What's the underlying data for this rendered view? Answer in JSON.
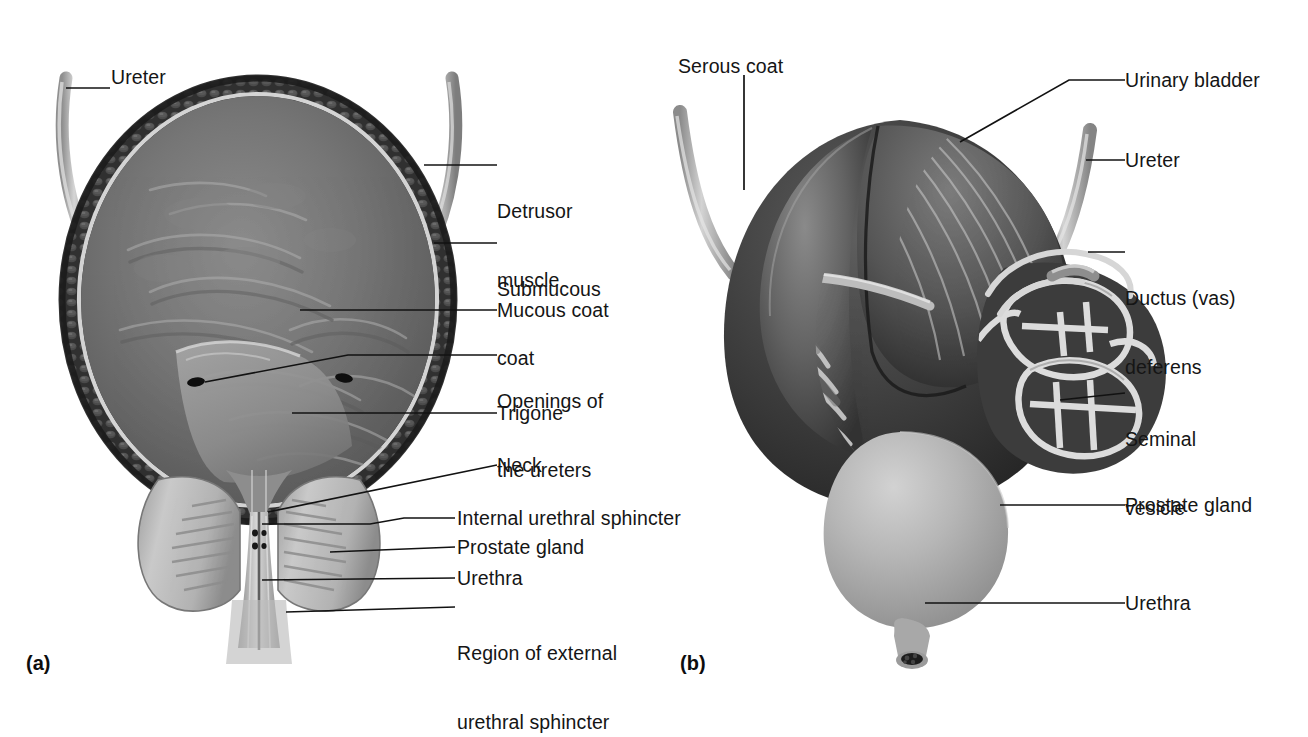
{
  "figure": {
    "background_color": "#ffffff",
    "ink_color": "#151515"
  },
  "panels": [
    {
      "id": "a",
      "letter": "(a)",
      "caption": "Longitudinal section of the urinary bladder and prostatic urethra",
      "labels": [
        {
          "key": "ureter",
          "text": "Ureter"
        },
        {
          "key": "detrusor",
          "text": "Detrusor\nmuscle",
          "line1": "Detrusor",
          "line2": "muscle"
        },
        {
          "key": "submucous",
          "text": "Submucous\ncoat",
          "line1": "Submucous",
          "line2": "coat"
        },
        {
          "key": "mucous",
          "text": "Mucous coat"
        },
        {
          "key": "openings",
          "text": "Openings of\nthe ureters",
          "line1": "Openings of",
          "line2": "the ureters"
        },
        {
          "key": "trigone",
          "text": "Trigone"
        },
        {
          "key": "neck",
          "text": "Neck"
        },
        {
          "key": "int_sphincter",
          "text": "Internal urethral sphincter"
        },
        {
          "key": "prostate",
          "text": "Prostate gland"
        },
        {
          "key": "urethra",
          "text": "Urethra"
        },
        {
          "key": "ext_sphincter",
          "text": "Region of external\nurethral sphincter",
          "line1": "Region of external",
          "line2": "urethral sphincter"
        }
      ]
    },
    {
      "id": "b",
      "letter": "(b)",
      "caption": "Posterior view of the urinary bladder with seminal vesicles and prostate",
      "labels": [
        {
          "key": "serous",
          "text": "Serous coat"
        },
        {
          "key": "bladder",
          "text": "Urinary bladder"
        },
        {
          "key": "ureter",
          "text": "Ureter"
        },
        {
          "key": "ductus",
          "text": "Ductus (vas)\ndeferens",
          "line1": "Ductus (vas)",
          "line2": "deferens"
        },
        {
          "key": "seminal",
          "text": "Seminal\nvesicle",
          "line1": "Seminal",
          "line2": "vesicle"
        },
        {
          "key": "prostate",
          "text": "Prostate gland"
        },
        {
          "key": "urethra",
          "text": "Urethra"
        }
      ]
    }
  ],
  "colors": {
    "leader_line": "#121212",
    "wall_outer": "#3a3a3a",
    "wall_dark": "#2a2a2a",
    "mucosa": "#6d6d6d",
    "submucous_band": "#d9d9d9",
    "prostate_light": "#b9b9b9",
    "ureter_tube": "#b0b0b0",
    "seminal_outline": "#dadada",
    "bladder_body_b": "#4a4a4a",
    "bladder_dome_b": "#6f6f6f"
  }
}
